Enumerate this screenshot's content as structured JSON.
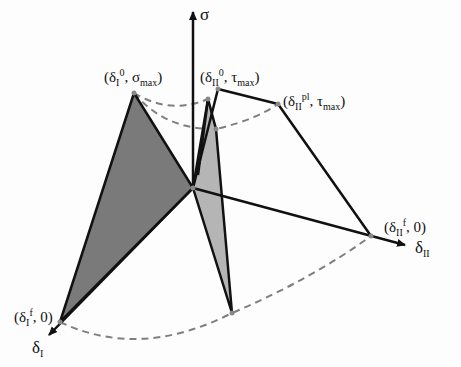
{
  "diagram": {
    "axes": {
      "sigma": {
        "label": "σ"
      },
      "delta_I": {
        "label": "δ",
        "sub": "I"
      },
      "delta_II": {
        "label": "δ",
        "sub": "II"
      }
    },
    "points": {
      "dI0_sigmax": {
        "open": "(δ",
        "sub": "I",
        "sup": "0",
        "mid": ", σ",
        "sub2": "max",
        "close": ")"
      },
      "dII0_taumax": {
        "open": "(δ",
        "sub": "II",
        "sup": "0",
        "mid": ", τ",
        "sub2": "max",
        "close": ")"
      },
      "dIIpl_taumax": {
        "open": "(δ",
        "sub": "II",
        "sup": "pl",
        "mid": ", τ",
        "sub2": "max",
        "close": ")"
      },
      "dIIf_0": {
        "open": "(δ",
        "sub": "II",
        "sup": "f",
        "mid": ", 0)"
      },
      "dIf_0": {
        "open": "(δ",
        "sub": "I",
        "sup": "f",
        "mid": ", 0)"
      }
    },
    "colors": {
      "dark_fill": "#7a7a7a",
      "light_fill": "#b5b5b5",
      "line": "#111111",
      "dashed": "#7f7f7f",
      "vertex": "#888888"
    }
  }
}
